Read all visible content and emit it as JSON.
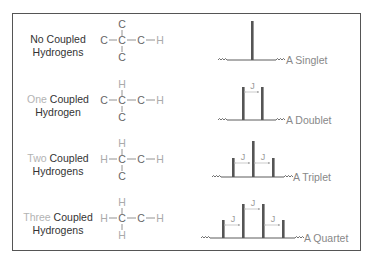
{
  "colors": {
    "frame": "#555555",
    "text_dark": "#333333",
    "text_light": "#b3b3b3",
    "atom_c": "#666666",
    "atom_h": "#aaaaaa",
    "peak": "#555555",
    "baseline": "#333333",
    "arrow": "#aaaaaa"
  },
  "rows": [
    {
      "count_word": "",
      "label_line1": "No Coupled",
      "label_line2": "Hydrogens",
      "molecule": {
        "top": "C",
        "left": "C",
        "center": "C",
        "right1": "C",
        "right2": "H",
        "bottom": "C"
      },
      "peak_name": "A Singlet",
      "coupling_label": "J"
    },
    {
      "count_word": "One",
      "label_line1": " Coupled",
      "label_line2": "Hydrogen",
      "molecule": {
        "top": "H",
        "left": "C",
        "center": "C",
        "right1": "C",
        "right2": "H",
        "bottom": "C"
      },
      "peak_name": "A Doublet",
      "coupling_label": "J"
    },
    {
      "count_word": "Two",
      "label_line1": " Coupled",
      "label_line2": "Hydrogens",
      "molecule": {
        "top": "H",
        "left": "H",
        "center": "C",
        "right1": "C",
        "right2": "H",
        "bottom": "C"
      },
      "peak_name": "A Triplet",
      "coupling_label": "J"
    },
    {
      "count_word": "Three",
      "label_line1": " Coupled",
      "label_line2": "Hydrogens",
      "molecule": {
        "top": "H",
        "left": "H",
        "center": "C",
        "right1": "C",
        "right2": "H",
        "bottom": "H"
      },
      "peak_name": "A Quartet",
      "coupling_label": "J"
    }
  ]
}
